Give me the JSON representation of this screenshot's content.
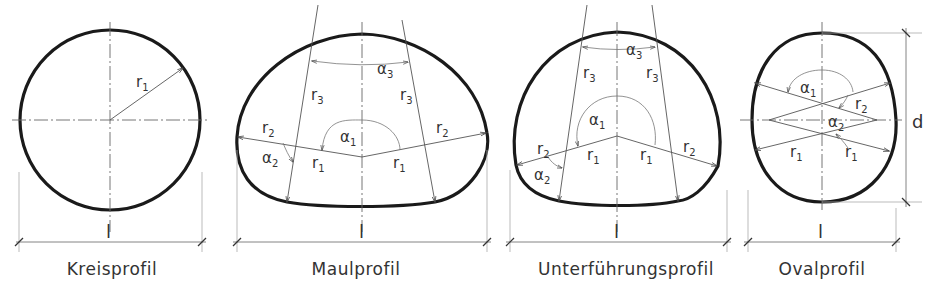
{
  "profiles": [
    {
      "id": "kreisprofil",
      "caption": "Kreisprofil",
      "dimension_width": "l",
      "labels": {
        "r1": "r",
        "r1_sub": "1"
      }
    },
    {
      "id": "maulprofil",
      "caption": "Maulprofil",
      "dimension_width": "l",
      "labels": {
        "r1": "r",
        "r1_sub": "1",
        "r2": "r",
        "r2_sub": "2",
        "r3": "r",
        "r3_sub": "3",
        "a1": "α",
        "a1_sub": "1",
        "a2": "α",
        "a2_sub": "2",
        "a3": "α",
        "a3_sub": "3"
      }
    },
    {
      "id": "unterfuehrungsprofil",
      "caption": "Unterführungsprofil",
      "dimension_width": "l",
      "labels": {
        "r1": "r",
        "r1_sub": "1",
        "r2": "r",
        "r2_sub": "2",
        "r3": "r",
        "r3_sub": "3",
        "a1": "α",
        "a1_sub": "1",
        "a2": "α",
        "a2_sub": "2",
        "a3": "α",
        "a3_sub": "3"
      }
    },
    {
      "id": "ovalprofil",
      "caption": "Ovalprofil",
      "dimension_width": "l",
      "dimension_height": "d",
      "labels": {
        "r1": "r",
        "r1_sub": "1",
        "r2": "r",
        "r2_sub": "2",
        "a1": "α",
        "a1_sub": "1",
        "a2": "α",
        "a2_sub": "2"
      }
    }
  ]
}
